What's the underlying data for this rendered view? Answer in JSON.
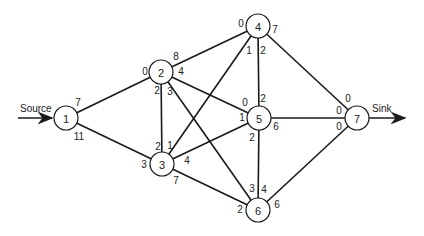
{
  "diagram": {
    "type": "network-flow-graph",
    "source_label": "Source",
    "sink_label": "Sink",
    "node_radius": 12,
    "nodes": [
      {
        "id": "1",
        "label": "1",
        "x": 66,
        "y": 118
      },
      {
        "id": "2",
        "label": "2",
        "x": 161,
        "y": 72
      },
      {
        "id": "3",
        "label": "3",
        "x": 162,
        "y": 164
      },
      {
        "id": "4",
        "label": "4",
        "x": 258,
        "y": 26
      },
      {
        "id": "5",
        "label": "5",
        "x": 259,
        "y": 118
      },
      {
        "id": "6",
        "label": "6",
        "x": 258,
        "y": 210
      },
      {
        "id": "7",
        "label": "7",
        "x": 357,
        "y": 118
      }
    ],
    "edges": [
      {
        "from": "1",
        "to": "2",
        "cap_from": "7",
        "cap_to": "0"
      },
      {
        "from": "1",
        "to": "3",
        "cap_from": "11",
        "cap_to": "3"
      },
      {
        "from": "2",
        "to": "3",
        "cap_from": "2",
        "cap_to": "2"
      },
      {
        "from": "2",
        "to": "4",
        "cap_from": "8",
        "cap_to": "0"
      },
      {
        "from": "2",
        "to": "6",
        "cap_from": "3",
        "cap_to": "2"
      },
      {
        "from": "2",
        "to": "5",
        "cap_from": "4",
        "cap_to": "0"
      },
      {
        "from": "3",
        "to": "4",
        "cap_from": "1",
        "cap_to": "1"
      },
      {
        "from": "3",
        "to": "5",
        "cap_from": "4",
        "cap_to": "1"
      },
      {
        "from": "3",
        "to": "6",
        "cap_from": "7",
        "cap_to": "3"
      },
      {
        "from": "4",
        "to": "5",
        "cap_from": "2",
        "cap_to": "2"
      },
      {
        "from": "4",
        "to": "7",
        "cap_from": "7",
        "cap_to": "0"
      },
      {
        "from": "5",
        "to": "6",
        "cap_from": "2",
        "cap_to": "4"
      },
      {
        "from": "5",
        "to": "7",
        "cap_from": "6",
        "cap_to": "0"
      },
      {
        "from": "6",
        "to": "7",
        "cap_from": "6",
        "cap_to": "0"
      }
    ],
    "edge_labels": [
      {
        "text": "7",
        "x": 78,
        "y": 102
      },
      {
        "text": "11",
        "x": 79,
        "y": 136
      },
      {
        "text": "0",
        "x": 145,
        "y": 71
      },
      {
        "text": "8",
        "x": 176,
        "y": 56
      },
      {
        "text": "4",
        "x": 181,
        "y": 71
      },
      {
        "text": "2",
        "x": 157,
        "y": 90
      },
      {
        "text": "3",
        "x": 170,
        "y": 91
      },
      {
        "text": "2",
        "x": 158,
        "y": 146
      },
      {
        "text": "1",
        "x": 170,
        "y": 145
      },
      {
        "text": "3",
        "x": 144,
        "y": 164
      },
      {
        "text": "4",
        "x": 187,
        "y": 160
      },
      {
        "text": "7",
        "x": 176,
        "y": 180
      },
      {
        "text": "0",
        "x": 241,
        "y": 23
      },
      {
        "text": "7",
        "x": 275,
        "y": 29
      },
      {
        "text": "1",
        "x": 249,
        "y": 50
      },
      {
        "text": "2",
        "x": 263,
        "y": 50
      },
      {
        "text": "0",
        "x": 245,
        "y": 102
      },
      {
        "text": "2",
        "x": 263,
        "y": 98
      },
      {
        "text": "1",
        "x": 242,
        "y": 117
      },
      {
        "text": "6",
        "x": 276,
        "y": 126
      },
      {
        "text": "2",
        "x": 252,
        "y": 137
      },
      {
        "text": "3",
        "x": 252,
        "y": 188
      },
      {
        "text": "4",
        "x": 264,
        "y": 189
      },
      {
        "text": "2",
        "x": 240,
        "y": 209
      },
      {
        "text": "6",
        "x": 277,
        "y": 204
      },
      {
        "text": "0",
        "x": 348,
        "y": 98
      },
      {
        "text": "0",
        "x": 339,
        "y": 110
      },
      {
        "text": "0",
        "x": 339,
        "y": 126
      }
    ]
  }
}
